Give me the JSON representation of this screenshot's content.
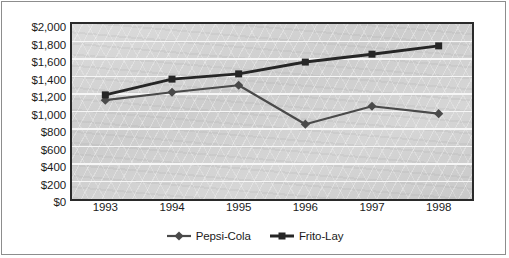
{
  "chart_data": {
    "type": "line",
    "title": "",
    "subtitle": "",
    "xlabel": "",
    "ylabel": "",
    "categories": [
      "1993",
      "1994",
      "1995",
      "1996",
      "1997",
      "1998"
    ],
    "series": [
      {
        "name": "Pepsi-Cola",
        "marker": "diamond",
        "color": "#4a4a4a",
        "values": [
          1130,
          1220,
          1300,
          855,
          1060,
          975
        ]
      },
      {
        "name": "Frito-Lay",
        "marker": "square",
        "color": "#262626",
        "values": [
          1190,
          1370,
          1430,
          1565,
          1655,
          1750
        ]
      }
    ],
    "ylim": [
      0,
      2000
    ],
    "ytick_step": 200,
    "ytick_labels": [
      "$0",
      "$200",
      "$400",
      "$600",
      "$800",
      "$1,000",
      "$1,200",
      "$1,400",
      "$1,600",
      "$1,800",
      "$2,000"
    ],
    "ytick_values": [
      0,
      200,
      400,
      600,
      800,
      1000,
      1200,
      1400,
      1600,
      1800,
      2000
    ],
    "grid": true,
    "grid_color": "#f6f6f6",
    "plot_background": "#d2d2d2",
    "legend_position": "bottom-center",
    "value_prefix": "$"
  },
  "legend": {
    "entries": [
      {
        "label": "Pepsi-Cola",
        "marker_name": "diamond-marker"
      },
      {
        "label": "Frito-Lay",
        "marker_name": "square-marker"
      }
    ]
  }
}
